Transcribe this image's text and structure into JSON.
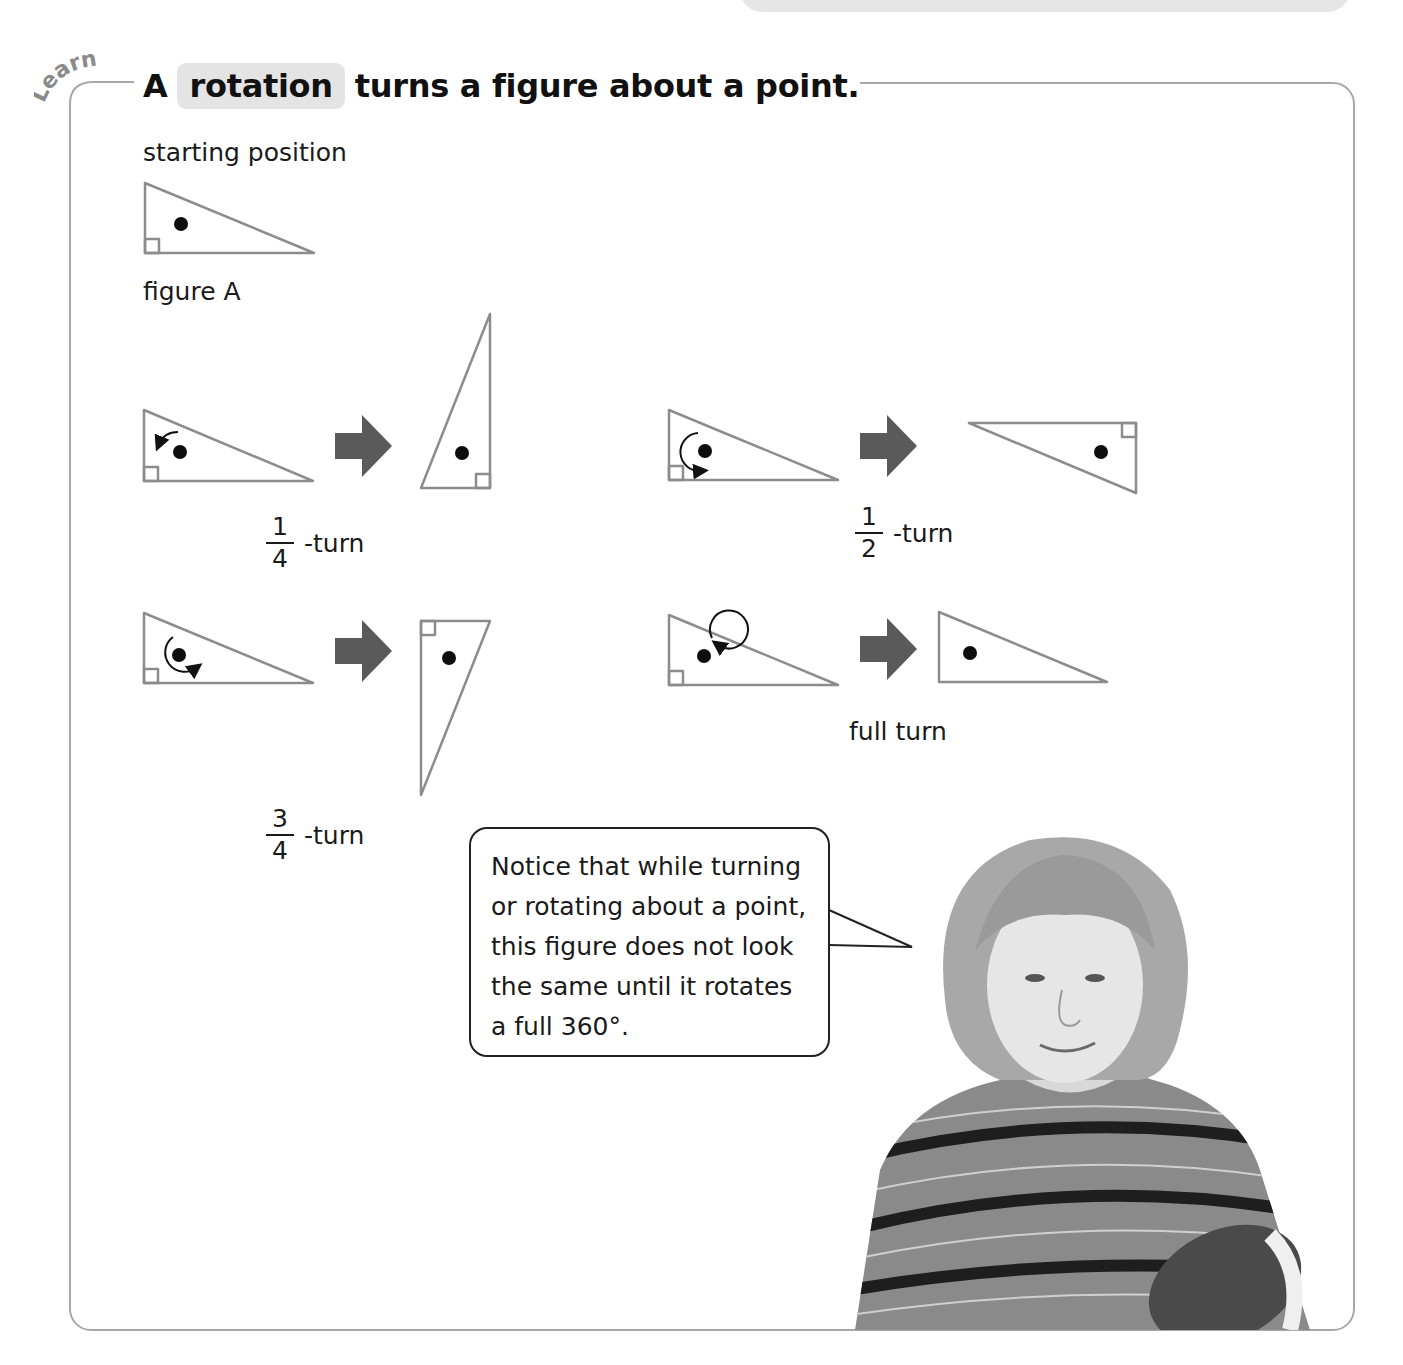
{
  "header": {
    "badge": "Learn",
    "title_prefix": "A",
    "title_term": "rotation",
    "title_suffix": "turns a figure about a point."
  },
  "starting": {
    "label": "starting position",
    "figure_label": "figure A"
  },
  "examples": [
    {
      "id": "quarter",
      "numerator": "1",
      "denominator": "4",
      "suffix": "-turn",
      "arrow": "counterclockwise quarter"
    },
    {
      "id": "half",
      "numerator": "1",
      "denominator": "2",
      "suffix": "-turn",
      "arrow": "clockwise half"
    },
    {
      "id": "three-quarter",
      "numerator": "3",
      "denominator": "4",
      "suffix": "-turn",
      "arrow": "clockwise three-quarter"
    },
    {
      "id": "full",
      "label": "full turn",
      "arrow": "clockwise full"
    }
  ],
  "bubble": {
    "lines": [
      "Notice that while turning",
      "or rotating about a point,",
      "this figure does not look",
      "the same until it rotates",
      "a full 360°."
    ]
  },
  "icons": {
    "transform_arrow": "right-arrow-icon",
    "rotation_marker": "rotation-arrow-icon",
    "center_point": "dot-icon",
    "right_angle": "right-angle-marker"
  },
  "colors": {
    "frame_border": "#a8a8a8",
    "triangle_stroke": "#8c8c8c",
    "arrow_fill": "#5a5a5a",
    "term_highlight": "#e4e4e4",
    "badge_text": "#8a8a8a",
    "top_tab": "#e6e6e6"
  }
}
